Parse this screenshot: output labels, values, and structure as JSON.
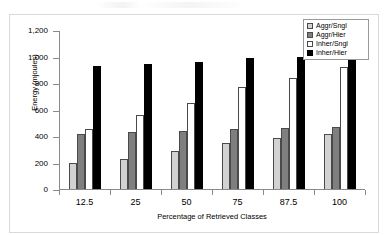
{
  "chart_data": {
    "type": "bar",
    "title": "",
    "xlabel": "Percentage of Retrieved Classes",
    "ylabel": "Energy (mjoules)",
    "categories": [
      "12.5",
      "25",
      "50",
      "75",
      "87.5",
      "100"
    ],
    "ylim": [
      0,
      1200
    ],
    "yticks": [
      "0",
      "200",
      "400",
      "600",
      "800",
      "1,000",
      "1,200"
    ],
    "ytick_values": [
      0,
      200,
      400,
      600,
      800,
      1000,
      1200
    ],
    "grid": false,
    "legend_position": "top-right",
    "series": [
      {
        "name": "Aggr/Sngl",
        "color": "#d2d2d2",
        "values": [
          193,
          225,
          288,
          345,
          387,
          415
        ]
      },
      {
        "name": "Aggr/Hier",
        "color": "#7f7f7f",
        "values": [
          412,
          428,
          437,
          452,
          462,
          466
        ]
      },
      {
        "name": "Inher/Sngl",
        "color": "#ffffff",
        "values": [
          450,
          558,
          648,
          773,
          838,
          920
        ]
      },
      {
        "name": "Inher/Hier",
        "color": "#000000",
        "values": [
          930,
          945,
          958,
          988,
          1000,
          1010
        ]
      }
    ]
  }
}
